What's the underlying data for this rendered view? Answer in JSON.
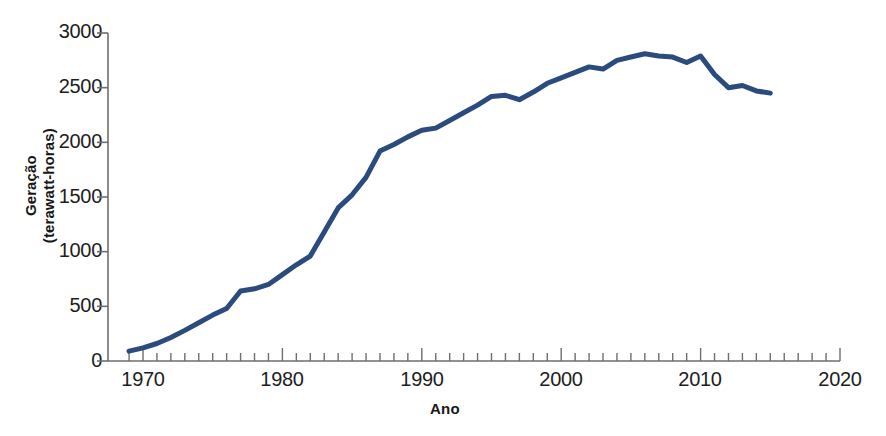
{
  "chart_data": {
    "type": "line",
    "title": "",
    "xlabel": "Ano",
    "ylabel": "Geração\n(terawatt-horas)",
    "ylabel_line1": "Geração",
    "ylabel_line2": "(terawatt-horas)",
    "xlim": [
      1968,
      2020
    ],
    "ylim": [
      0,
      3000
    ],
    "yticks": [
      0,
      500,
      1000,
      1500,
      2000,
      2500,
      3000
    ],
    "ytick_labels": [
      "0",
      "500",
      "1000",
      "1500",
      "2000",
      "2500",
      "3000"
    ],
    "xticks": [
      1970,
      1980,
      1990,
      2000,
      2010,
      2020
    ],
    "xtick_labels": [
      "1970",
      "1980",
      "1990",
      "2000",
      "2010",
      "2020"
    ],
    "minor_tick_interval": 1,
    "grid": false,
    "legend": null,
    "line_color": "#2b4a7d",
    "line_width": 5,
    "axis_color": "#6e6e6e",
    "series": [
      {
        "name": "Geração nuclear mundial",
        "x": [
          1969,
          1970,
          1971,
          1972,
          1973,
          1974,
          1975,
          1976,
          1977,
          1978,
          1979,
          1980,
          1981,
          1982,
          1983,
          1984,
          1985,
          1986,
          1987,
          1988,
          1989,
          1990,
          1991,
          1992,
          1993,
          1994,
          1995,
          1996,
          1997,
          1998,
          1999,
          2000,
          2001,
          2002,
          2003,
          2004,
          2005,
          2006,
          2007,
          2008,
          2009,
          2010,
          2011,
          2012,
          2013,
          2014,
          2015
        ],
        "values": [
          90,
          120,
          160,
          215,
          280,
          350,
          420,
          480,
          640,
          660,
          700,
          790,
          880,
          960,
          1180,
          1400,
          1520,
          1680,
          1920,
          1980,
          2050,
          2110,
          2130,
          2200,
          2270,
          2340,
          2420,
          2430,
          2390,
          2460,
          2540,
          2590,
          2640,
          2690,
          2670,
          2750,
          2780,
          2810,
          2790,
          2780,
          2730,
          2790,
          2620,
          2500,
          2520,
          2470,
          2450
        ]
      }
    ]
  }
}
